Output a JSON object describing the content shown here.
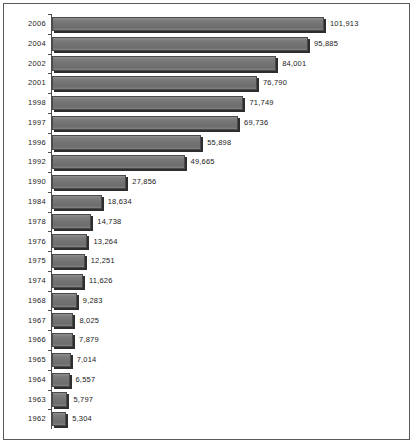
{
  "chart": {
    "background_color": "#ffffff",
    "bar_color": "#7a7a7a",
    "bar_border_color": "#4a4a4a",
    "shadow_color": "#2e2e2e",
    "axis_color": "#4d4d4d",
    "frame_color": "#5a5a5a",
    "label_color": "#1a1a1a"
  },
  "chart_data": {
    "type": "bar",
    "orientation": "horizontal",
    "title": "",
    "subtitle": "",
    "xlabel": "",
    "ylabel": "",
    "grid": false,
    "legend": false,
    "legend_position": "none",
    "xlim": [
      0,
      101913
    ],
    "data_labels": true,
    "categories": [
      "2006",
      "2004",
      "2002",
      "2001",
      "1998",
      "1997",
      "1996",
      "1992",
      "1990",
      "1984",
      "1978",
      "1976",
      "1975",
      "1974",
      "1968",
      "1967",
      "1966",
      "1965",
      "1964",
      "1963",
      "1962"
    ],
    "values": [
      101913,
      95885,
      84001,
      76790,
      71749,
      69736,
      55898,
      49665,
      27856,
      18634,
      14738,
      13264,
      12251,
      11626,
      9283,
      8025,
      7879,
      7014,
      6557,
      5797,
      5304
    ],
    "value_labels": [
      "101,913",
      "95,885",
      "84,001",
      "76,790",
      "71,749",
      "69,736",
      "55,898",
      "49,665",
      "27,856",
      "18,634",
      "14,738",
      "13,264",
      "12,251",
      "11,626",
      "9,283",
      "8,025",
      "7,879",
      "7,014",
      "6,557",
      "5,797",
      "5,304"
    ]
  }
}
